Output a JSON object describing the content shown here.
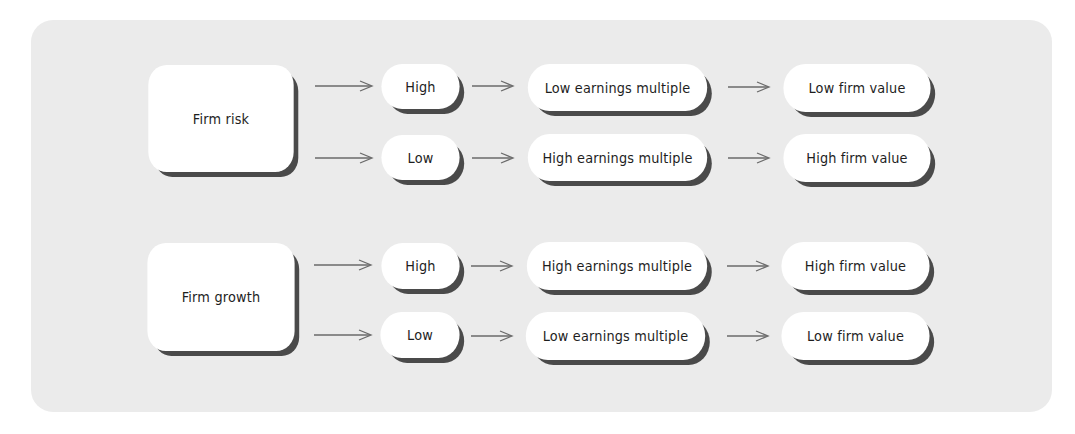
{
  "diagram": {
    "groups": [
      {
        "driver": "Firm risk",
        "branches": [
          {
            "level": "High",
            "multiple": "Low earnings multiple",
            "value": "Low firm value"
          },
          {
            "level": "Low",
            "multiple": "High earnings multiple",
            "value": "High firm value"
          }
        ]
      },
      {
        "driver": "Firm growth",
        "branches": [
          {
            "level": "High",
            "multiple": "High earnings multiple",
            "value": "High firm value"
          },
          {
            "level": "Low",
            "multiple": "Low earnings multiple",
            "value": "Low firm value"
          }
        ]
      }
    ],
    "colors": {
      "panel": "#ebebeb",
      "node": "#ffffff",
      "shadow": "#4a4a4a",
      "arrow": "#6a6a6a",
      "text": "#1e1e1e"
    }
  }
}
